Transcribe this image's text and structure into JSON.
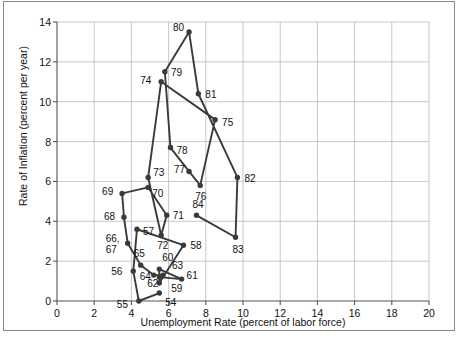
{
  "chart_data": {
    "type": "scatter",
    "title": "",
    "xlabel": "Unemployment Rate (percent of labor force)",
    "ylabel": "Rate of Inflation (percent per year)",
    "xlim": [
      0,
      20
    ],
    "ylim": [
      0,
      14
    ],
    "xticks": [
      0,
      2,
      4,
      6,
      8,
      10,
      12,
      14,
      16,
      18,
      20
    ],
    "yticks": [
      0,
      2,
      4,
      6,
      8,
      10,
      12,
      14
    ],
    "grid": true,
    "legend": "none",
    "connected": true,
    "series": [
      {
        "name": "Phillips curve path",
        "points": [
          {
            "label": "54",
            "x": 5.5,
            "y": 0.4
          },
          {
            "label": "55",
            "x": 4.4,
            "y": 0.0
          },
          {
            "label": "56",
            "x": 4.1,
            "y": 1.5
          },
          {
            "label": "57",
            "x": 4.3,
            "y": 3.6
          },
          {
            "label": "58",
            "x": 6.8,
            "y": 2.8
          },
          {
            "label": "59",
            "x": 5.5,
            "y": 0.9
          },
          {
            "label": "60",
            "x": 5.5,
            "y": 1.6
          },
          {
            "label": "61",
            "x": 6.7,
            "y": 1.1
          },
          {
            "label": "62",
            "x": 5.5,
            "y": 1.2
          },
          {
            "label": "63",
            "x": 5.7,
            "y": 1.3
          },
          {
            "label": "64",
            "x": 5.2,
            "y": 1.3
          },
          {
            "label": "65",
            "x": 4.5,
            "y": 1.8
          },
          {
            "label": "66,",
            "x": 3.8,
            "y": 2.9
          },
          {
            "label": "67",
            "x": 3.8,
            "y": 2.9
          },
          {
            "label": "68",
            "x": 3.6,
            "y": 4.2
          },
          {
            "label": "69",
            "x": 3.5,
            "y": 5.4
          },
          {
            "label": "70",
            "x": 4.9,
            "y": 5.7
          },
          {
            "label": "71",
            "x": 5.9,
            "y": 4.3
          },
          {
            "label": "72",
            "x": 5.6,
            "y": 3.3
          },
          {
            "label": "73",
            "x": 4.9,
            "y": 6.2
          },
          {
            "label": "74",
            "x": 5.6,
            "y": 11.0
          },
          {
            "label": "75",
            "x": 8.5,
            "y": 9.1
          },
          {
            "label": "76",
            "x": 7.7,
            "y": 5.8
          },
          {
            "label": "77",
            "x": 7.1,
            "y": 6.5
          },
          {
            "label": "78",
            "x": 6.1,
            "y": 7.7
          },
          {
            "label": "79",
            "x": 5.8,
            "y": 11.5
          },
          {
            "label": "80",
            "x": 7.1,
            "y": 13.5
          },
          {
            "label": "81",
            "x": 7.6,
            "y": 10.4
          },
          {
            "label": "82",
            "x": 9.7,
            "y": 6.2
          },
          {
            "label": "83",
            "x": 9.6,
            "y": 3.2
          },
          {
            "label": "84",
            "x": 7.5,
            "y": 4.3
          }
        ],
        "order": [
          "54",
          "55",
          "56",
          "57",
          "58",
          "59",
          "60",
          "61",
          "62",
          "63",
          "64",
          "65",
          "66,",
          "68",
          "69",
          "70",
          "71",
          "72",
          "73",
          "74",
          "75",
          "76",
          "77",
          "78",
          "79",
          "80",
          "81",
          "82",
          "83",
          "84"
        ]
      }
    ],
    "label_offsets": {
      "54": {
        "dx": 6,
        "dy": 10
      },
      "55": {
        "dx": -22,
        "dy": 4
      },
      "56": {
        "dx": -22,
        "dy": 1
      },
      "57": {
        "dx": 6,
        "dy": 3
      },
      "58": {
        "dx": 7,
        "dy": 1
      },
      "59": {
        "dx": 12,
        "dy": 6
      },
      "60": {
        "dx": 3,
        "dy": -11
      },
      "61": {
        "dx": 5,
        "dy": -3
      },
      "62": {
        "dx": -12,
        "dy": 7
      },
      "63": {
        "dx": 9,
        "dy": -9
      },
      "64": {
        "dx": -14,
        "dy": 2
      },
      "65": {
        "dx": -7,
        "dy": -11
      },
      "66,": {
        "dx": -22,
        "dy": -4
      },
      "67": {
        "dx": -22,
        "dy": 7
      },
      "68": {
        "dx": -20,
        "dy": 0
      },
      "69": {
        "dx": -20,
        "dy": -1
      },
      "70": {
        "dx": 4,
        "dy": 7
      },
      "71": {
        "dx": 6,
        "dy": 1
      },
      "72": {
        "dx": -4,
        "dy": 11
      },
      "73": {
        "dx": 5,
        "dy": -4
      },
      "74": {
        "dx": -21,
        "dy": -1
      },
      "75": {
        "dx": 7,
        "dy": 3
      },
      "76": {
        "dx": -5,
        "dy": 12
      },
      "77": {
        "dx": -15,
        "dy": -1
      },
      "78": {
        "dx": 6,
        "dy": 3
      },
      "79": {
        "dx": 6,
        "dy": 1
      },
      "80": {
        "dx": -16,
        "dy": -4
      },
      "81": {
        "dx": 7,
        "dy": 1
      },
      "82": {
        "dx": 7,
        "dy": 2
      },
      "83": {
        "dx": -3,
        "dy": 13
      },
      "84": {
        "dx": -4,
        "dy": -10
      }
    },
    "colors": {
      "marker": "#3a3a3a",
      "line": "#3a3a3a",
      "grid": "#b9b9b9",
      "axis": "#555555",
      "text": "#111111",
      "background": "#ffffff",
      "border": "#8a8a8a"
    }
  }
}
